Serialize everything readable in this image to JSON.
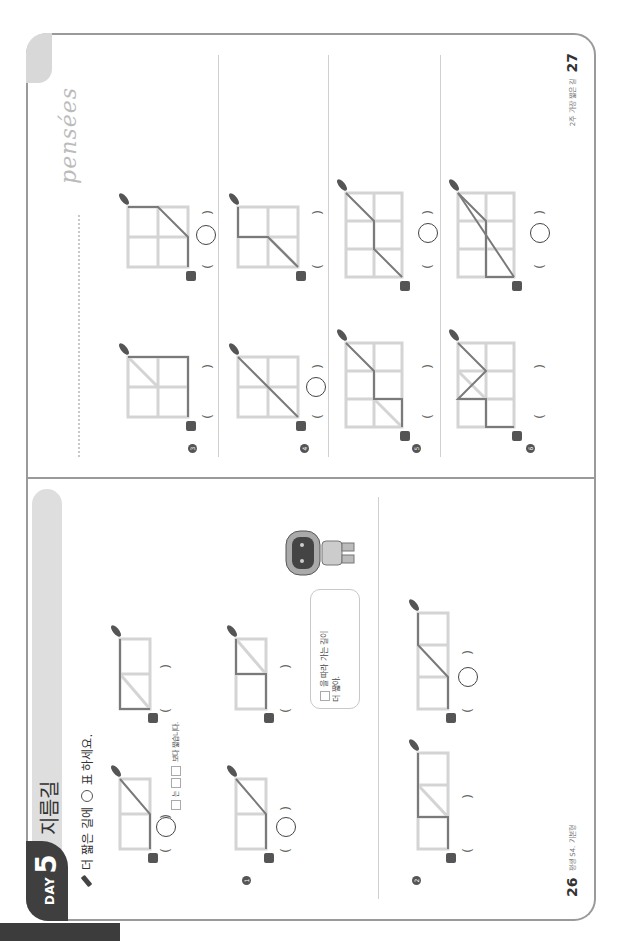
{
  "left_page": {
    "day_label": "DAY",
    "day_number": "5",
    "title": "지름길",
    "instruction_before": "더 짧은 길에",
    "instruction_after": "표 하세요.",
    "hint_text_1": "는",
    "hint_text_2": "보다 짧습니다.",
    "speech_bubble_line1": "을 따라 가는 길이",
    "speech_bubble_line2": "더 짧아.",
    "page_number": "26",
    "footer_text": "평생 S4. 기본형",
    "paren_open": "(",
    "paren_close": ")",
    "example": {
      "options": [
        {
          "grid": "2x1",
          "path": "diag-lower",
          "selected": true
        },
        {
          "grid": "2x1",
          "path": "L-with-diag",
          "selected": false
        }
      ]
    },
    "problems": [
      {
        "number": "1",
        "options": [
          {
            "grid": "2x1",
            "path": "diag-lower",
            "selected": true
          },
          {
            "grid": "2x1",
            "path": "step",
            "selected": false
          }
        ]
      },
      {
        "number": "2",
        "options": [
          {
            "grid": "3x1",
            "path": "step",
            "selected": false
          },
          {
            "grid": "3x1",
            "path": "diag-middle",
            "selected": true
          }
        ]
      }
    ]
  },
  "right_page": {
    "header_word": "pensées",
    "page_number": "27",
    "footer_text": "2주 가장 짧은 길",
    "paren_open": "(",
    "paren_close": ")",
    "problems": [
      {
        "number": "3",
        "options": [
          {
            "grid": "2x2",
            "path": "edge",
            "selected": false
          },
          {
            "grid": "2x2",
            "path": "diag-one",
            "selected": true
          }
        ]
      },
      {
        "number": "4",
        "options": [
          {
            "grid": "2x2",
            "path": "full-diag",
            "selected": true
          },
          {
            "grid": "2x2",
            "path": "step-diag",
            "selected": false
          }
        ]
      },
      {
        "number": "5",
        "options": [
          {
            "grid": "3x2",
            "path": "diag-step-diag-2",
            "selected": false
          },
          {
            "grid": "3x2",
            "path": "diag-step-diag",
            "selected": true
          }
        ]
      },
      {
        "number": "6",
        "options": [
          {
            "grid": "3x2",
            "path": "diag-step-edge",
            "selected": false
          },
          {
            "grid": "3x2",
            "path": "diag-diag-edge",
            "selected": true
          }
        ]
      }
    ]
  },
  "icons": {
    "start": "cat-icon",
    "end": "fish-icon",
    "marker": "pencil-icon"
  },
  "colors": {
    "grid_line": "#d4d4d4",
    "path_line": "#7a7a7a",
    "badge_bg": "#3f3f3f",
    "title_bar": "#dedede",
    "frame": "#9a9a9a"
  }
}
